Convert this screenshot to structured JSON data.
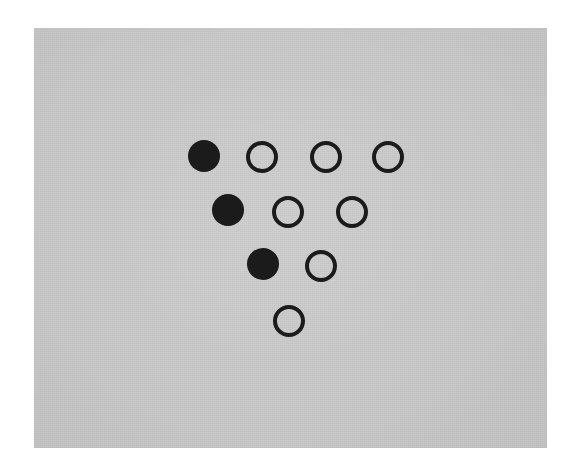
{
  "figure": {
    "kind": "dot-array-stimulus",
    "background_color": "#ffffff",
    "panel_color": "#c9c9c9",
    "dot_fill_color": "#1b1b1b",
    "dot_stroke_color": "#1b1b1b",
    "panel": {
      "x": 34,
      "y": 28,
      "width": 513,
      "height": 420
    },
    "dot_diameter": 32,
    "open_stroke_width": 4,
    "total_dots": 10,
    "filled_count": 3,
    "open_count": 7,
    "rows": [
      {
        "row_index": 1,
        "count": 4,
        "dots": [
          {
            "style": "filled",
            "x": 188,
            "y": 140
          },
          {
            "style": "open",
            "x": 246,
            "y": 141
          },
          {
            "style": "open",
            "x": 310,
            "y": 141
          },
          {
            "style": "open",
            "x": 372,
            "y": 141
          }
        ]
      },
      {
        "row_index": 2,
        "count": 3,
        "dots": [
          {
            "style": "filled",
            "x": 212,
            "y": 194
          },
          {
            "style": "open",
            "x": 272,
            "y": 196
          },
          {
            "style": "open",
            "x": 336,
            "y": 196
          }
        ]
      },
      {
        "row_index": 3,
        "count": 2,
        "dots": [
          {
            "style": "filled",
            "x": 247,
            "y": 248
          },
          {
            "style": "open",
            "x": 305,
            "y": 250
          }
        ]
      },
      {
        "row_index": 4,
        "count": 1,
        "dots": [
          {
            "style": "open",
            "x": 273,
            "y": 305
          }
        ]
      }
    ]
  }
}
